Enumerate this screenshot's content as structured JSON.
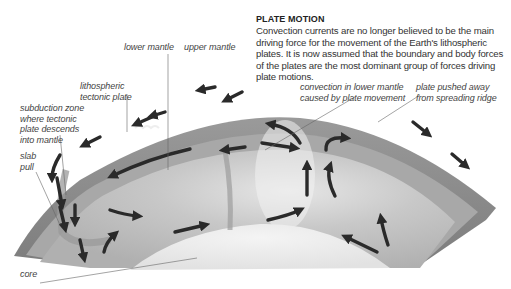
{
  "panel": {
    "title": "PLATE MOTION",
    "body": "Convection currents are no longer believed to be the main driving force for the movement of the Earth's lithospheric plates. It is now assumed that the boundary and body forces of the plates are the most dominant group of forces driving plate motions."
  },
  "labels": {
    "lower_mantle": "lower mantle",
    "upper_mantle": "upper mantle",
    "lithospheric_1": "lithospheric",
    "lithospheric_2": "tectonic plate",
    "subduction_1": "subduction zone",
    "subduction_2": "where tectonic",
    "subduction_3": "plate descends",
    "subduction_4": "into mantle",
    "slab_1": "slab",
    "slab_2": "pull",
    "convection_1": "convection in lower mantle",
    "convection_2": "caused by plate movement",
    "pushed_1": "plate pushed away",
    "pushed_2": "from spreading ridge",
    "core": "core"
  },
  "colors": {
    "crust": "#8c8c8c",
    "upper_mantle": "#a9a9a9",
    "lower_mantle": "#cfcfcf",
    "core": "#ececec",
    "arrow": "#2a2a2a",
    "leader": "#666666"
  },
  "icons": [
    "convection-arrow",
    "plate-motion-arrow",
    "leader-line"
  ]
}
